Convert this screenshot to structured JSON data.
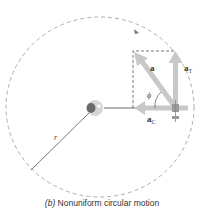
{
  "diagram": {
    "labels": {
      "a": "a",
      "aT_main": "a",
      "aT_sub": "T",
      "ac_main": "a",
      "ac_sub": "C",
      "phi": "ϕ",
      "r": "r"
    },
    "caption": {
      "prefix": "(b)",
      "text": "Nonuniform circular motion"
    },
    "colors": {
      "path": "#999999",
      "vector": "#c8c8c8",
      "box": "#555555",
      "radius": "#555555"
    }
  }
}
